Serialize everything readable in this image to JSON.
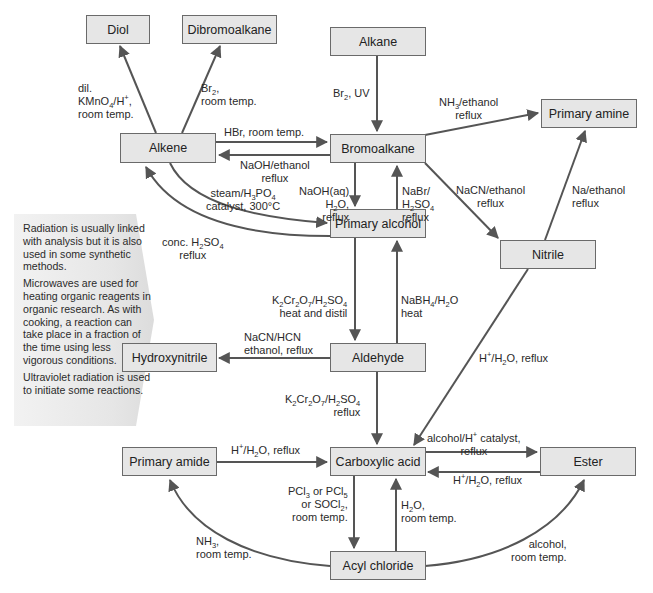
{
  "nodes": {
    "diol": "Diol",
    "dibromoalkane": "Dibromoalkane",
    "alkane": "Alkane",
    "alkene": "Alkene",
    "bromoalkane": "Bromoalkane",
    "primary_amine": "Primary amine",
    "primary_alcohol": "Primary alcohol",
    "nitrile": "Nitrile",
    "hydroxynitrile": "Hydroxynitrile",
    "aldehyde": "Aldehyde",
    "primary_amide": "Primary amide",
    "carboxylic_acid": "Carboxylic acid",
    "ester": "Ester",
    "acyl_chloride": "Acyl chloride"
  },
  "reactions": {
    "alkene_to_diol": [
      "dil.",
      "KMnO4/H+,",
      "room temp."
    ],
    "alkene_to_dibromoalkane": [
      "Br2,",
      "room temp."
    ],
    "alkane_to_bromoalkane": [
      "Br2, UV"
    ],
    "alkene_to_bromoalkane": [
      "HBr, room temp."
    ],
    "bromoalkane_to_alkene": [
      "NaOH/ethanol",
      "reflux"
    ],
    "bromoalkane_to_primary_amine": [
      "NH3/ethanol",
      "reflux"
    ],
    "alkene_to_primary_alcohol": [
      "steam/H3PO4",
      "catalyst, 300°C"
    ],
    "bromoalkane_to_primary_alcohol": [
      "NaOH(aq)",
      "H2O,",
      "reflux"
    ],
    "primary_alcohol_to_bromoalkane": [
      "NaBr/",
      "H2SO4",
      "reflux"
    ],
    "bromoalkane_to_nitrile": [
      "NaCN/ethanol",
      "reflux"
    ],
    "nitrile_to_primary_amine": [
      "Na/ethanol",
      "reflux"
    ],
    "primary_alcohol_to_alkene": [
      "conc. H2SO4",
      "reflux"
    ],
    "primary_alcohol_to_aldehyde": [
      "K2Cr2O7/H2SO4",
      "heat and distil"
    ],
    "aldehyde_to_primary_alcohol": [
      "NaBH4/H2O",
      "heat"
    ],
    "aldehyde_to_hydroxynitrile": [
      "NaCN/HCN",
      "ethanol, reflux"
    ],
    "nitrile_to_carboxylic_acid": [
      "H+/H2O, reflux"
    ],
    "aldehyde_to_carboxylic_acid": [
      "K2Cr2O7/H2SO4",
      "reflux"
    ],
    "primary_amide_to_carboxylic_acid": [
      "H+/H2O, reflux"
    ],
    "carboxylic_acid_to_ester": [
      "alcohol/H+ catalyst,",
      "reflux"
    ],
    "ester_to_carboxylic_acid": [
      "H+/H2O, reflux"
    ],
    "carboxylic_acid_to_acyl_chloride": [
      "PCl3 or PCl5",
      "or SOCl2,",
      "room temp."
    ],
    "acyl_chloride_to_carboxylic_acid": [
      "H2O,",
      "room temp."
    ],
    "acyl_chloride_to_primary_amide": [
      "NH3,",
      "room temp."
    ],
    "acyl_chloride_to_ester": [
      "alcohol,",
      "room temp."
    ]
  },
  "sidebar": {
    "paragraphs": [
      "Radiation is usually linked with analysis but it is also used in some synthetic methods.",
      "Microwaves are used for heating organic reagents in organic research. As with cooking, a reaction can take place in a fraction of the time using less vigorous conditions.",
      "Ultraviolet radiation is used to initiate some reactions."
    ]
  },
  "colors": {
    "box_fill": "#e6e6e6",
    "box_border": "#6a6a6a",
    "arrow": "#555555",
    "sidebar_fill": "#e9e9e9"
  }
}
